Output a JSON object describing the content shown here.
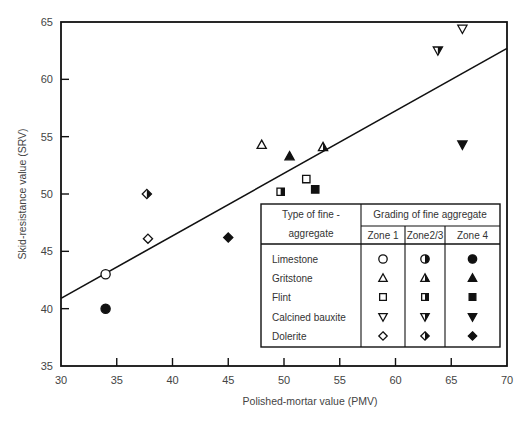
{
  "chart_data": {
    "type": "scatter",
    "title": "",
    "xlabel": "Polished-mortar value (PMV)",
    "ylabel": "Skid-resistance value (SRV)",
    "xlim": [
      30,
      70
    ],
    "ylim": [
      35,
      65
    ],
    "xticks": [
      30,
      35,
      40,
      45,
      50,
      55,
      60,
      65,
      70
    ],
    "yticks": [
      35,
      40,
      45,
      50,
      55,
      60,
      65
    ],
    "grid": false,
    "trendline": {
      "x": [
        30,
        70
      ],
      "y": [
        40.9,
        62.7
      ]
    },
    "series": [
      {
        "aggregate": "Limestone",
        "zone": "Zone 1",
        "marker": "circle",
        "fill": "open",
        "points": [
          [
            34,
            43
          ]
        ]
      },
      {
        "aggregate": "Limestone",
        "zone": "Zone 4",
        "marker": "circle",
        "fill": "solid",
        "points": [
          [
            34,
            40
          ]
        ]
      },
      {
        "aggregate": "Gritstone",
        "zone": "Zone 1",
        "marker": "triangle-up",
        "fill": "open",
        "points": [
          [
            48,
            54.3
          ]
        ]
      },
      {
        "aggregate": "Gritstone",
        "zone": "Zone 2/3",
        "marker": "triangle-up",
        "fill": "half",
        "points": [
          [
            53.5,
            54.1
          ]
        ]
      },
      {
        "aggregate": "Gritstone",
        "zone": "Zone 4",
        "marker": "triangle-up",
        "fill": "solid",
        "points": [
          [
            50.5,
            53.3
          ]
        ]
      },
      {
        "aggregate": "Flint",
        "zone": "Zone 1",
        "marker": "square",
        "fill": "open",
        "points": [
          [
            52,
            51.3
          ]
        ]
      },
      {
        "aggregate": "Flint",
        "zone": "Zone 2/3",
        "marker": "square",
        "fill": "half",
        "points": [
          [
            49.7,
            50.2
          ]
        ]
      },
      {
        "aggregate": "Flint",
        "zone": "Zone 4",
        "marker": "square",
        "fill": "solid",
        "points": [
          [
            52.8,
            50.4
          ]
        ]
      },
      {
        "aggregate": "Calcined bauxite",
        "zone": "Zone 1",
        "marker": "triangle-down",
        "fill": "open",
        "points": [
          [
            66,
            64.4
          ]
        ]
      },
      {
        "aggregate": "Calcined bauxite",
        "zone": "Zone 2/3",
        "marker": "triangle-down",
        "fill": "half",
        "points": [
          [
            63.8,
            62.5
          ]
        ]
      },
      {
        "aggregate": "Calcined bauxite",
        "zone": "Zone 4",
        "marker": "triangle-down",
        "fill": "solid",
        "points": [
          [
            66,
            54.3
          ]
        ]
      },
      {
        "aggregate": "Dolerite",
        "zone": "Zone 1",
        "marker": "diamond",
        "fill": "open",
        "points": [
          [
            37.8,
            46.1
          ]
        ]
      },
      {
        "aggregate": "Dolerite",
        "zone": "Zone 2/3",
        "marker": "diamond",
        "fill": "half",
        "points": [
          [
            37.7,
            50
          ]
        ]
      },
      {
        "aggregate": "Dolerite",
        "zone": "Zone 4",
        "marker": "diamond",
        "fill": "solid",
        "points": [
          [
            45,
            46.2
          ]
        ]
      }
    ],
    "legend": {
      "position": "lower-right inside",
      "col_header_type": "Type of fine -",
      "col_header_type_2": "aggregate",
      "col_header_grading": "Grading of fine aggregate",
      "zones": [
        "Zone 1",
        "Zone2/3",
        "Zone 4"
      ],
      "rows": [
        "Limestone",
        "Gritstone",
        "Flint",
        "Calcined bauxite",
        "Dolerite"
      ]
    }
  },
  "colors": {
    "ink": "#111111",
    "text": "#444444",
    "background": "#ffffff"
  }
}
